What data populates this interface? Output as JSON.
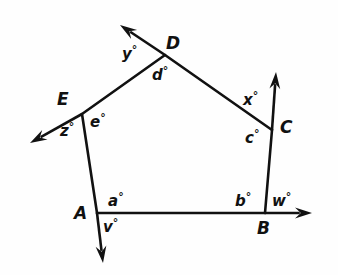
{
  "figure": {
    "background_color": "#fefefe",
    "stroke_color": "#111111",
    "text_color": "#111111",
    "width": 338,
    "height": 275
  },
  "vertices": [
    {
      "id": "A",
      "label": "A",
      "x": 97,
      "y": 213,
      "label_x": 74,
      "label_y": 205
    },
    {
      "id": "B",
      "label": "B",
      "x": 265,
      "y": 213,
      "label_x": 257,
      "label_y": 220
    },
    {
      "id": "C",
      "label": "C",
      "x": 272,
      "y": 130,
      "label_x": 280,
      "label_y": 119
    },
    {
      "id": "D",
      "label": "D",
      "x": 165,
      "y": 55,
      "label_x": 166,
      "label_y": 35
    },
    {
      "id": "E",
      "label": "E",
      "x": 82,
      "y": 114,
      "label_x": 57,
      "label_y": 91
    }
  ],
  "sides": [
    {
      "from": "A",
      "to": "B"
    },
    {
      "from": "B",
      "to": "C"
    },
    {
      "from": "C",
      "to": "D"
    },
    {
      "from": "D",
      "to": "E"
    },
    {
      "from": "E",
      "to": "A"
    }
  ],
  "rays": [
    {
      "id": "ray-ab-beyond-b",
      "from": "A",
      "through": "B",
      "tip_x": 312,
      "tip_y": 213,
      "exterior_angle": "w"
    },
    {
      "id": "ray-bc-beyond-c",
      "from": "B",
      "through": "C",
      "tip_x": 276,
      "tip_y": 72,
      "exterior_angle": "x"
    },
    {
      "id": "ray-cd-beyond-d",
      "from": "C",
      "through": "D",
      "tip_x": 120,
      "tip_y": 25,
      "exterior_angle": "y"
    },
    {
      "id": "ray-de-beyond-e",
      "from": "D",
      "through": "E",
      "tip_x": 30,
      "tip_y": 143,
      "exterior_angle": "z"
    },
    {
      "id": "ray-ea-beyond-a",
      "from": "E",
      "through": "A",
      "tip_x": 103,
      "tip_y": 263,
      "exterior_angle": "v"
    }
  ],
  "interior_angle_labels": [
    {
      "id": "angle-a",
      "variable": "a",
      "text": "a",
      "degree": "°",
      "x": 108,
      "y": 191,
      "at_vertex": "A"
    },
    {
      "id": "angle-b",
      "variable": "b",
      "text": "b",
      "degree": "°",
      "x": 235,
      "y": 191,
      "at_vertex": "B"
    },
    {
      "id": "angle-c",
      "variable": "c",
      "text": "c",
      "degree": "°",
      "x": 245,
      "y": 128,
      "at_vertex": "C"
    },
    {
      "id": "angle-d",
      "variable": "d",
      "text": "d",
      "degree": "°",
      "x": 152,
      "y": 65,
      "at_vertex": "D"
    },
    {
      "id": "angle-e",
      "variable": "e",
      "text": "e",
      "degree": "°",
      "x": 90,
      "y": 112,
      "at_vertex": "E"
    }
  ],
  "exterior_angle_labels": [
    {
      "id": "angle-v",
      "variable": "v",
      "text": "v",
      "degree": "°",
      "x": 103,
      "y": 217,
      "at_vertex": "A"
    },
    {
      "id": "angle-w",
      "variable": "w",
      "text": "w",
      "degree": "°",
      "x": 272,
      "y": 191,
      "at_vertex": "B"
    },
    {
      "id": "angle-x",
      "variable": "x",
      "text": "x",
      "degree": "°",
      "x": 243,
      "y": 90,
      "at_vertex": "C"
    },
    {
      "id": "angle-y",
      "variable": "y",
      "text": "y",
      "degree": "°",
      "x": 122,
      "y": 44,
      "at_vertex": "D"
    },
    {
      "id": "angle-z",
      "variable": "z",
      "text": "z",
      "degree": "°",
      "x": 60,
      "y": 121,
      "at_vertex": "E"
    }
  ]
}
